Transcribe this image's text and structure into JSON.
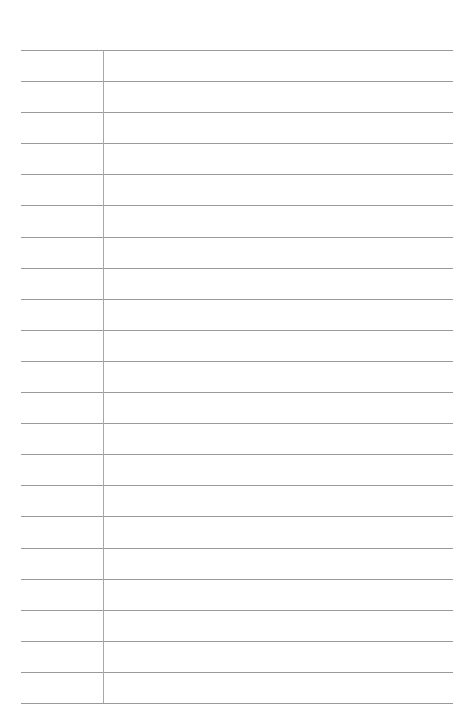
{
  "page": {
    "type": "lined-paper",
    "line_count": 22,
    "has_margin_line": true,
    "line_color": "#9a9a9a",
    "margin_color": "#a8a8a8",
    "background": "#ffffff"
  }
}
